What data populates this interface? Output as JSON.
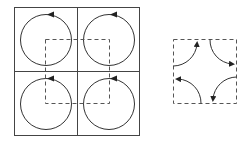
{
  "figure": {
    "left_panel": {
      "description": "2x2 grid of cells, each containing a circulating loop with an arrowhead at top; dashed square spans the cell centers",
      "cells": [
        {
          "id": "top-left",
          "circulation": "counterclockwise"
        },
        {
          "id": "top-right",
          "circulation": "counterclockwise"
        },
        {
          "id": "bottom-left",
          "circulation": "counterclockwise"
        },
        {
          "id": "bottom-right",
          "circulation": "counterclockwise"
        }
      ]
    },
    "right_panel": {
      "description": "dashed square with four quarter-arc arrows at its corners (net boundary contributions)"
    },
    "colors": {
      "line": "#333333",
      "grid": "#444444",
      "dashed": "#555555"
    }
  }
}
